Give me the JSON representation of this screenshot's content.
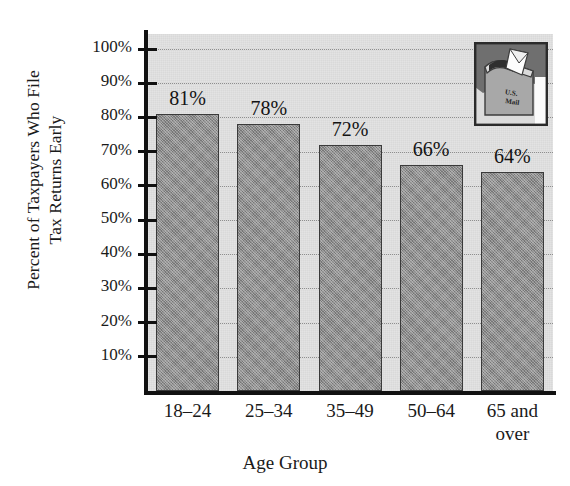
{
  "chart_data": {
    "type": "bar",
    "title": "",
    "xlabel": "Age Group",
    "ylabel_line1": "Percent of Taxpayers Who File",
    "ylabel_line2": "Tax Returns Early",
    "categories": [
      "18–24",
      "25–34",
      "35–49",
      "50–64",
      "65 and\nover"
    ],
    "values": [
      81,
      78,
      72,
      66,
      64
    ],
    "data_labels": [
      "81%",
      "78%",
      "72%",
      "66%",
      "64%"
    ],
    "ytick_labels": [
      "100%",
      "90%",
      "80%",
      "70%",
      "60%",
      "50%",
      "40%",
      "30%",
      "20%",
      "10%"
    ],
    "ytick_values": [
      100,
      90,
      80,
      70,
      60,
      50,
      40,
      30,
      20,
      10
    ],
    "ylim": [
      0,
      104
    ],
    "grid": true,
    "grid_style": "dotted-horizontal",
    "legend": "none",
    "bar_color": "#8d8d8d",
    "bar_edge_color": "#3a3a3a",
    "plot_background": "#e3e3e3",
    "page_background": "#ffffff",
    "axis_color": "#111111"
  },
  "inset": {
    "name": "mailbox-photo",
    "caption_line1": "U.S.",
    "caption_line2": "Mail",
    "description": "mailbox with envelope"
  }
}
